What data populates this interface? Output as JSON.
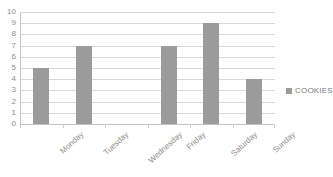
{
  "chart_data": {
    "type": "bar",
    "title": "",
    "xlabel": "",
    "ylabel": "",
    "categories": [
      "Monday",
      "Tuesday",
      "Wednesday",
      "Friday",
      "Saturday",
      "Sunday"
    ],
    "values": [
      5,
      7,
      0,
      7,
      9,
      4
    ],
    "series": [
      {
        "name": "COOKIES",
        "values": [
          5,
          7,
          0,
          7,
          9,
          4
        ],
        "color": "#9b9b9b"
      }
    ],
    "ylim": [
      0,
      10
    ],
    "ytick_labels": [
      "10",
      "9",
      "8",
      "7",
      "6",
      "5",
      "4",
      "3",
      "2",
      "1",
      "0"
    ],
    "ytick_values": [
      10,
      9,
      8,
      7,
      6,
      5,
      4,
      3,
      2,
      1,
      0
    ],
    "grid": true,
    "grid_axis": "y",
    "legend_position": "right",
    "legend_entries": [
      "COOKIES"
    ],
    "annotations": []
  },
  "legend": {
    "label": "COOKIES"
  },
  "colors": {
    "bar": "#9b9b9b",
    "gridline": "#d9d9d9",
    "axis": "#c4c4c4",
    "text": "#8d8d8d",
    "background": "#ffffff"
  }
}
